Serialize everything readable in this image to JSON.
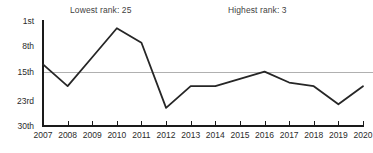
{
  "chart_data": {
    "type": "line",
    "title": "",
    "xlabel": "",
    "ylabel": "",
    "categories": [
      "2007",
      "2008",
      "2009",
      "2010",
      "2011",
      "2012",
      "2013",
      "2014",
      "2015",
      "2016",
      "2017",
      "2018",
      "2019",
      "2020"
    ],
    "x": [
      2007,
      2008,
      2009,
      2010,
      2011,
      2012,
      2013,
      2014,
      2015,
      2016,
      2017,
      2018,
      2019,
      2020
    ],
    "values": [
      13,
      19,
      11,
      3,
      7,
      25,
      19,
      19,
      17,
      15,
      18,
      19,
      24,
      19
    ],
    "series": [
      {
        "name": "Rank",
        "values": [
          13,
          19,
          11,
          3,
          7,
          25,
          19,
          19,
          17,
          15,
          18,
          19,
          24,
          19
        ]
      }
    ],
    "ylim": [
      1,
      30
    ],
    "y_inverted": true,
    "yticks": [
      1,
      8,
      15,
      23,
      30
    ],
    "ytick_labels": [
      "1st",
      "8th",
      "15th",
      "23rd",
      "30th"
    ],
    "xticks": [
      2007,
      2008,
      2009,
      2010,
      2011,
      2012,
      2013,
      2014,
      2015,
      2016,
      2017,
      2018,
      2019,
      2020
    ],
    "xtick_labels": [
      "2007",
      "2008",
      "2009",
      "2010",
      "2011",
      "2012",
      "2013",
      "2014",
      "2015",
      "2016",
      "2017",
      "2018",
      "2019",
      "2020"
    ],
    "grid": false,
    "legend": false,
    "reference_line": {
      "value": 15,
      "label": "",
      "color": "#b0b0b0"
    },
    "annotations": [
      {
        "name": "lowest",
        "text": "Lowest rank: 25",
        "value": 25,
        "at_category": "2012"
      },
      {
        "name": "highest",
        "text": "Highest rank: 3",
        "value": 3,
        "at_category": "2010"
      }
    ],
    "colors": {
      "line": "#262626",
      "axis": "#1a1a1a",
      "reference_line": "#b0b0b0",
      "tick_label": "#2b2b2b",
      "annotation_text": "#3f3f3f",
      "background": "#ffffff"
    }
  }
}
